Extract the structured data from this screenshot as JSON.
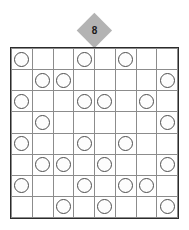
{
  "puzzle": {
    "title": "Circle placement grid puzzle",
    "clue_marker": {
      "icon": "diamond-marker",
      "value": "8",
      "shape": "diamond",
      "fill_color": "#b3b3b3",
      "text_color": "#1a1a1a"
    },
    "grid": {
      "rows": 8,
      "columns": 8,
      "border_color": "#2b2b2b",
      "cell_line_color": "#8c8c8c",
      "cell_background": "#ffffff",
      "token": {
        "icon": "circle-token",
        "stroke_color": "#4d4d4d",
        "fill_color": "#fdfdfd"
      },
      "filled_cells": [
        [
          1,
          0,
          0,
          1,
          0,
          1,
          0,
          0
        ],
        [
          0,
          1,
          1,
          0,
          0,
          0,
          0,
          1
        ],
        [
          1,
          0,
          0,
          1,
          1,
          0,
          1,
          0
        ],
        [
          0,
          1,
          0,
          0,
          0,
          0,
          0,
          1
        ],
        [
          1,
          0,
          0,
          1,
          0,
          1,
          0,
          0
        ],
        [
          0,
          1,
          1,
          0,
          1,
          0,
          0,
          1
        ],
        [
          1,
          0,
          0,
          1,
          0,
          1,
          1,
          0
        ],
        [
          0,
          0,
          1,
          0,
          1,
          0,
          0,
          1
        ]
      ],
      "circle_count": 27
    }
  }
}
